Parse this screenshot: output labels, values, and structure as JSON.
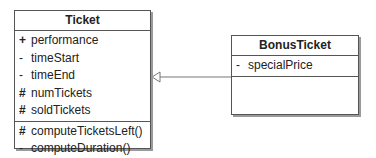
{
  "diagram_type": "UML class diagram",
  "classes": [
    {
      "name": "Ticket",
      "attributes": [
        {
          "visibility": "+",
          "name": "performance"
        },
        {
          "visibility": "-",
          "name": "timeStart"
        },
        {
          "visibility": "-",
          "name": "timeEnd"
        },
        {
          "visibility": "#",
          "name": "numTickets"
        },
        {
          "visibility": "#",
          "name": "soldTickets"
        }
      ],
      "methods": [
        {
          "visibility": "#",
          "name": "computeTicketsLeft()"
        },
        {
          "visibility": "-",
          "name": "computeDuration()"
        }
      ]
    },
    {
      "name": "BonusTicket",
      "attributes": [
        {
          "visibility": "-",
          "name": "specialPrice"
        }
      ],
      "methods": []
    }
  ],
  "relationships": [
    {
      "type": "generalization",
      "from": "BonusTicket",
      "to": "Ticket"
    }
  ],
  "colors": {
    "line": "#555555",
    "shadow": "#9a9a9a",
    "fill": "#ffffff"
  }
}
